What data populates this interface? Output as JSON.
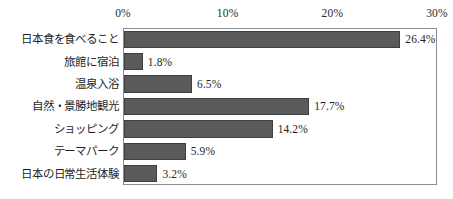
{
  "chart_data": {
    "type": "bar",
    "orientation": "horizontal",
    "title": "",
    "xlabel": "",
    "ylabel": "",
    "xlim": [
      0,
      30
    ],
    "grid": false,
    "legend": null,
    "axis_ticks": [
      "0%",
      "10%",
      "20%",
      "30%"
    ],
    "axis_tick_values": [
      0,
      10,
      20,
      30
    ],
    "categories": [
      "日本食を食べること",
      "旅館に宿泊",
      "温泉入浴",
      "自然・景勝地観光",
      "ショッピング",
      "テーマパーク",
      "日本の日常生活体験"
    ],
    "values": [
      26.4,
      1.8,
      6.5,
      17.7,
      14.2,
      5.9,
      3.2
    ],
    "value_labels": [
      "26.4%",
      "1.8%",
      "6.5%",
      "17.7%",
      "14.2%",
      "5.9%",
      "3.2%"
    ],
    "bar_color": "#5a5a5a",
    "bar_edge_color": "#3f3f3f",
    "frame_color": "#8d8d8d",
    "text_color": "#1f1f1f"
  }
}
